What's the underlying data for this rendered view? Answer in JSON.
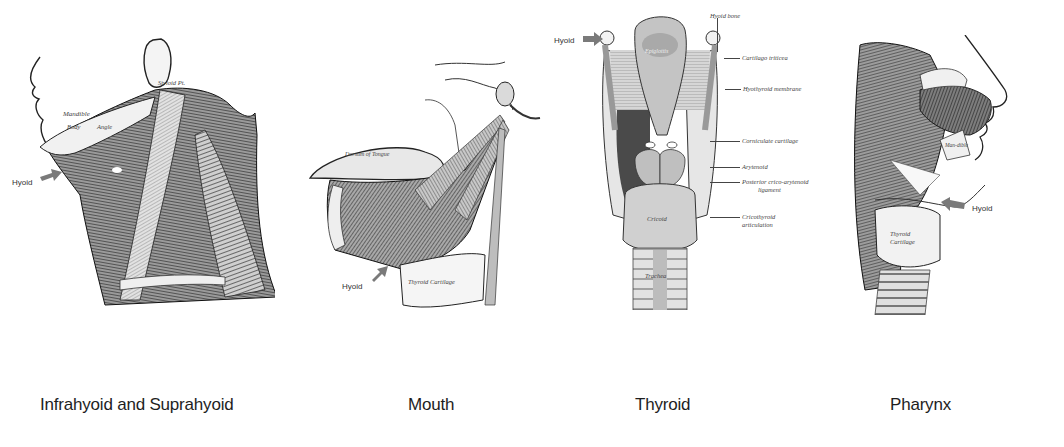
{
  "panels": [
    {
      "id": "infrahyoid-suprahyoid",
      "caption": "Infrahyoid and Suprahyoid",
      "pointer_label": "Hyoid",
      "anatomy_labels": [
        "Mandible",
        "Body",
        "Angle",
        "Styloid Pt."
      ]
    },
    {
      "id": "mouth",
      "caption": "Mouth",
      "pointer_label": "Hyoid",
      "anatomy_labels": [
        "Dorsum of Tongue",
        "Thyroid Cartilage"
      ]
    },
    {
      "id": "thyroid",
      "caption": "Thyroid",
      "pointer_label": "Hyoid",
      "anatomy_labels": [
        "Hyoid bone",
        "Cartilago triticea",
        "Hyothyroid membrane",
        "Corniculate cartilage",
        "Arytenoid",
        "Posterior crico-arytenoid",
        "ligament",
        "Cricothyroid",
        "articulation",
        "Epiglottis",
        "Cricoid",
        "Trachea"
      ]
    },
    {
      "id": "pharynx",
      "caption": "Pharynx",
      "pointer_label": "Hyoid",
      "anatomy_labels": [
        "Maxilla",
        "Man-dible",
        "Thyroid",
        "Cartilage"
      ]
    }
  ],
  "colors": {
    "background": "#ffffff",
    "arrow": "#7a7a7a",
    "ink": "#2b2b2b",
    "caption": "#1e1e1e"
  }
}
